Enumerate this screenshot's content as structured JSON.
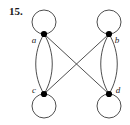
{
  "figure": {
    "number_label": "15.",
    "caption": ""
  },
  "colors": {
    "background": "#ffffff",
    "stroke": "#3a3a3a",
    "vertex_fill": "#000000",
    "label_text": "#1a1a1a"
  },
  "graph": {
    "title": "",
    "vertices": [
      {
        "id": "a",
        "label": "a",
        "cx": 44,
        "cy": 34,
        "r": 3.1,
        "label_x": 34,
        "label_y": 43
      },
      {
        "id": "b",
        "label": "b",
        "cx": 109,
        "cy": 34,
        "r": 3.1,
        "label_x": 115,
        "label_y": 43
      },
      {
        "id": "c",
        "label": "c",
        "cx": 44,
        "cy": 94,
        "r": 3.1,
        "label_x": 33,
        "label_y": 93
      },
      {
        "id": "d",
        "label": "d",
        "cx": 109,
        "cy": 94,
        "r": 3.1,
        "label_x": 115,
        "label_y": 93
      }
    ],
    "self_loops": [
      {
        "id": "loop-a",
        "vertex": "a",
        "cx": 44,
        "cy": 22,
        "r": 12,
        "position": "above"
      },
      {
        "id": "loop-b",
        "vertex": "b",
        "cx": 109,
        "cy": 22,
        "r": 12,
        "position": "above"
      },
      {
        "id": "loop-c",
        "vertex": "c",
        "cx": 44,
        "cy": 106,
        "r": 12,
        "position": "below"
      },
      {
        "id": "loop-d",
        "vertex": "d",
        "cx": 109,
        "cy": 106,
        "r": 12,
        "position": "below"
      }
    ],
    "curved_edges": [
      {
        "id": "edge-ac-left",
        "from": "a",
        "to": "c",
        "path": "M 44 34 C 33 52, 33 76, 44 94"
      },
      {
        "id": "edge-ac-right",
        "from": "a",
        "to": "c",
        "path": "M 44 34 C 55 52, 55 76, 44 94"
      },
      {
        "id": "edge-bd-left",
        "from": "b",
        "to": "d",
        "path": "M 109 34 C 98 52, 98 76, 109 94"
      },
      {
        "id": "edge-bd-right",
        "from": "b",
        "to": "d",
        "path": "M 109 34 C 120 52, 120 76, 109 94"
      }
    ],
    "straight_edges": [
      {
        "id": "edge-ad",
        "from": "a",
        "to": "d",
        "x1": 44,
        "y1": 34,
        "x2": 109,
        "y2": 94
      },
      {
        "id": "edge-bc",
        "from": "b",
        "to": "c",
        "x1": 109,
        "y1": 34,
        "x2": 44,
        "y2": 94
      }
    ],
    "crossing_point": {
      "x": 76,
      "y": 64
    },
    "stroke_width": 0.9
  }
}
